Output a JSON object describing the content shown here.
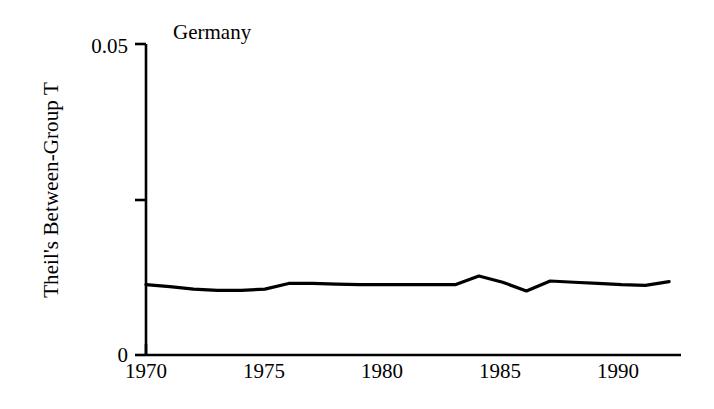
{
  "chart_data": {
    "type": "line",
    "title": "Germany",
    "xlabel": "",
    "ylabel": "Theil's Between-Group T",
    "xlim": [
      1970,
      1992.5
    ],
    "ylim": [
      0,
      0.05
    ],
    "grid": false,
    "legend": null,
    "y_ticks": [
      {
        "value": 0.05,
        "label": "0.05"
      },
      {
        "value": 0.025,
        "label": ""
      },
      {
        "value": 0,
        "label": "0"
      }
    ],
    "x_ticks": [
      {
        "value": 1970,
        "label": "1970"
      },
      {
        "value": 1975,
        "label": "1975"
      },
      {
        "value": 1980,
        "label": "1980"
      },
      {
        "value": 1985,
        "label": "1985"
      },
      {
        "value": 1990,
        "label": "1990"
      }
    ],
    "series": [
      {
        "name": "Germany",
        "color": "#000000",
        "x": [
          1970,
          1971,
          1972,
          1973,
          1974,
          1975,
          1976,
          1977,
          1978,
          1979,
          1980,
          1981,
          1982,
          1983,
          1984,
          1985,
          1986,
          1987,
          1988,
          1989,
          1990,
          1991,
          1992
        ],
        "values": [
          0.0113,
          0.011,
          0.0106,
          0.0104,
          0.0104,
          0.0106,
          0.0115,
          0.0115,
          0.0114,
          0.0113,
          0.0113,
          0.0113,
          0.0113,
          0.0113,
          0.0127,
          0.0117,
          0.0103,
          0.0119,
          0.0117,
          0.0115,
          0.0113,
          0.0112,
          0.0118
        ]
      }
    ]
  },
  "axis": {
    "line_color": "#000000"
  }
}
